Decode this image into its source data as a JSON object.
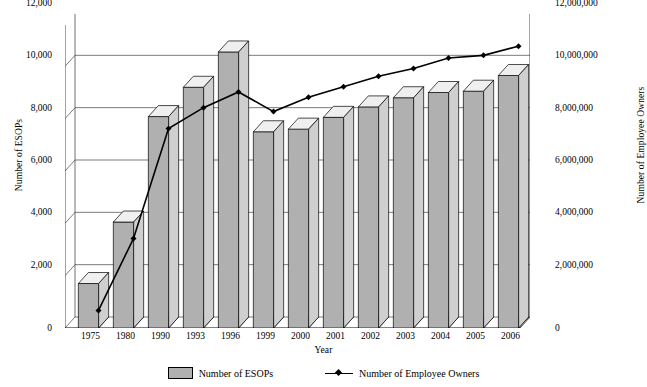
{
  "chart_data": {
    "type": "bar",
    "title": "",
    "xlabel": "Year",
    "ylabel": "Number of ESOPs",
    "ylabel_secondary": "Number of Employee Owners",
    "categories": [
      "1975",
      "1980",
      "1990",
      "1993",
      "1996",
      "1999",
      "2000",
      "2001",
      "2002",
      "2003",
      "2004",
      "2005",
      "2006"
    ],
    "ylim": [
      0,
      12000
    ],
    "ylim_secondary": [
      0,
      12000000
    ],
    "yticks": [
      "0",
      "2,000",
      "4,000",
      "6,000",
      "8,000",
      "10,000",
      "12,000"
    ],
    "yticks_secondary": [
      "0",
      "2,000,000",
      "4,000,000",
      "6,000,000",
      "8,000,000",
      "10,000,000",
      "12,000,000"
    ],
    "grid": true,
    "legend_position": "bottom",
    "series": [
      {
        "name": "Number of ESOPs",
        "kind": "bar",
        "axis": "left",
        "color": "#b0b0b0",
        "values": [
          1700,
          4050,
          8080,
          9200,
          10550,
          7500,
          7600,
          8050,
          8450,
          8800,
          9000,
          9050,
          9650
        ]
      },
      {
        "name": "Number of Employee Owners",
        "kind": "line",
        "axis": "right",
        "color": "#000000",
        "values": [
          250000,
          3000000,
          7200000,
          8000000,
          8600000,
          7850000,
          8400000,
          8800000,
          9200000,
          9500000,
          9900000,
          10000000,
          10350000
        ]
      }
    ]
  },
  "legend": {
    "bars_label": "Number of ESOPs",
    "line_label": "Number of Employee Owners"
  }
}
